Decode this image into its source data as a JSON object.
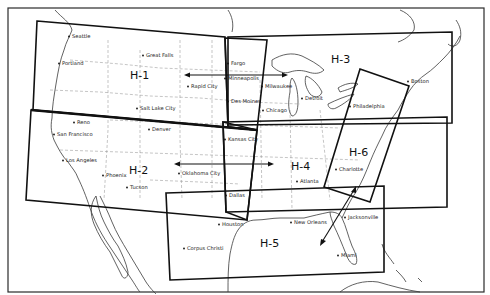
{
  "map": {
    "type": "enroute-high-altitude-chart-index",
    "colors": {
      "background": "#ffffff",
      "ink": "#111111",
      "borders": "#8a8a8a"
    },
    "charts": [
      {
        "id": "h1",
        "label": "H-1",
        "x": 130,
        "y": 79
      },
      {
        "id": "h2",
        "label": "H-2",
        "x": 129,
        "y": 174
      },
      {
        "id": "h3",
        "label": "H-3",
        "x": 331,
        "y": 63
      },
      {
        "id": "h4",
        "label": "H-4",
        "x": 291,
        "y": 170
      },
      {
        "id": "h5",
        "label": "H-5",
        "x": 260,
        "y": 247
      },
      {
        "id": "h6",
        "label": "H-6",
        "x": 349,
        "y": 156
      }
    ],
    "cities": [
      {
        "name": "Seattle",
        "x": 72,
        "y": 38
      },
      {
        "name": "Portland",
        "x": 62,
        "y": 65
      },
      {
        "name": "Great Falls",
        "x": 146,
        "y": 57
      },
      {
        "name": "Fargo",
        "x": 231,
        "y": 65
      },
      {
        "name": "Minneapolis",
        "x": 228,
        "y": 80
      },
      {
        "name": "Rapid City",
        "x": 191,
        "y": 88
      },
      {
        "name": "Milwaukee",
        "x": 265,
        "y": 88
      },
      {
        "name": "Des Moines",
        "x": 231,
        "y": 103
      },
      {
        "name": "Detroit",
        "x": 305,
        "y": 100
      },
      {
        "name": "Chicago",
        "x": 266,
        "y": 112
      },
      {
        "name": "Salt Lake City",
        "x": 140,
        "y": 110
      },
      {
        "name": "Boston",
        "x": 411,
        "y": 83
      },
      {
        "name": "Philadelphia",
        "x": 353,
        "y": 108
      },
      {
        "name": "Reno",
        "x": 77,
        "y": 124
      },
      {
        "name": "San Francisco",
        "x": 57,
        "y": 136
      },
      {
        "name": "Denver",
        "x": 152,
        "y": 131
      },
      {
        "name": "Kansas City",
        "x": 228,
        "y": 141
      },
      {
        "name": "Los Angeles",
        "x": 66,
        "y": 162
      },
      {
        "name": "Phoenix",
        "x": 106,
        "y": 177
      },
      {
        "name": "Oklahoma City",
        "x": 182,
        "y": 175
      },
      {
        "name": "Tucson",
        "x": 130,
        "y": 189
      },
      {
        "name": "Charlotte",
        "x": 339,
        "y": 171
      },
      {
        "name": "Atlanta",
        "x": 300,
        "y": 183
      },
      {
        "name": "Dallas",
        "x": 229,
        "y": 197
      },
      {
        "name": "Houston",
        "x": 222,
        "y": 226
      },
      {
        "name": "New Orleans",
        "x": 294,
        "y": 224
      },
      {
        "name": "Jacksonville",
        "x": 348,
        "y": 219
      },
      {
        "name": "Corpus Christi",
        "x": 187,
        "y": 250
      },
      {
        "name": "Miami",
        "x": 341,
        "y": 257
      }
    ]
  }
}
